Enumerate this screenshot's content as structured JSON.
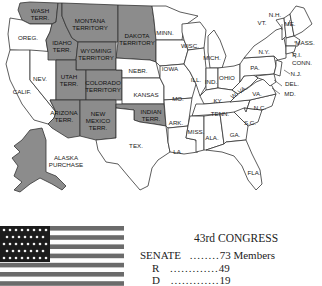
{
  "map": {
    "territories": [
      {
        "id": "wash",
        "label": [
          "WASH",
          "TERR."
        ]
      },
      {
        "id": "montana",
        "label": [
          "MONTANA",
          "TERRITORY"
        ]
      },
      {
        "id": "dakota",
        "label": [
          "DAKOTA",
          "TERRITORY"
        ]
      },
      {
        "id": "idaho",
        "label": [
          "IDAHO",
          "TERR."
        ]
      },
      {
        "id": "wyoming",
        "label": [
          "WYOMING",
          "TERRITORY"
        ]
      },
      {
        "id": "utah",
        "label": [
          "UTAH",
          "TERR."
        ]
      },
      {
        "id": "colorado",
        "label": [
          "COLORADO",
          "TERRITORY"
        ]
      },
      {
        "id": "arizona",
        "label": [
          "ARIZONA",
          "TERR."
        ]
      },
      {
        "id": "new_mexico",
        "label": [
          "NEW",
          "MEXICO",
          "TERR."
        ]
      },
      {
        "id": "indian",
        "label": [
          "INDIAN",
          "TERR."
        ]
      },
      {
        "id": "alaska",
        "label": [
          "ALASKA",
          "PURCHASE"
        ]
      }
    ],
    "states": [
      "OREG.",
      "CALIF.",
      "NEV.",
      "NEBR.",
      "KANSAS",
      "TEX.",
      "MINN.",
      "IOWA",
      "MO.",
      "ARK.",
      "LA.",
      "WISC.",
      "ILL.",
      "MICH.",
      "IND.",
      "OHIO",
      "KY.",
      "TENN.",
      "MISS.",
      "ALA.",
      "GA.",
      "FLA.",
      "S.C.",
      "N.C.",
      "VA.",
      "W. VA.",
      "PA.",
      "N.Y.",
      "VT.",
      "N.H.",
      "ME.",
      "MASS.",
      "R.I.",
      "CONN.",
      "N.J.",
      "DEL.",
      "MD."
    ],
    "colors": {
      "territory": "#8c8c8c",
      "state": "#ffffff",
      "border": "#333333"
    }
  },
  "flag": {
    "stars_rows": 5,
    "description": "37-star U.S. flag"
  },
  "legend": {
    "title": "43rd CONGRESS",
    "senate_label": "SENATE",
    "senate_dots": "........",
    "senate_value": "73 Members",
    "r_label": "R",
    "r_dots": ".............",
    "r_value": "49",
    "d_label": "D",
    "d_dots": ".............",
    "d_value": "19"
  }
}
